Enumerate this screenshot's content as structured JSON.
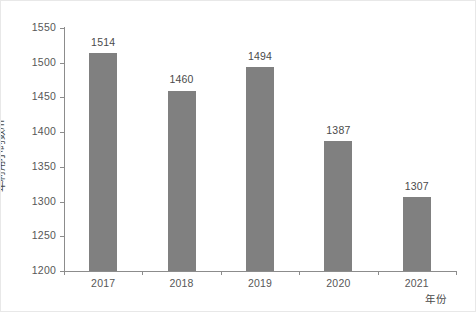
{
  "chart_data": {
    "type": "bar",
    "title": "",
    "subtitle": "",
    "categories": [
      "2017",
      "2018",
      "2019",
      "2020",
      "2021"
    ],
    "values": [
      1514,
      1460,
      1494,
      1387,
      1307
    ],
    "data_labels": [
      "1514",
      "1460",
      "1494",
      "1387",
      "1307"
    ],
    "xlabel": "年份",
    "ylabel": "年利用小时数/h",
    "ylim": [
      1200,
      1550
    ],
    "y_ticks": [
      1200,
      1250,
      1300,
      1350,
      1400,
      1450,
      1500,
      1550
    ],
    "y_tick_labels": [
      "1200",
      "1250",
      "1300",
      "1350",
      "1400",
      "1450",
      "1500",
      "1550"
    ],
    "grid": false,
    "legend": null,
    "legend_position": "none",
    "series": [
      {
        "name": "年利用小时数",
        "values": [
          1514,
          1460,
          1494,
          1387,
          1307
        ]
      }
    ],
    "colors": {
      "bar_fill": "#808080",
      "axis_line": "#8c8c8c",
      "tick_label": "#575757",
      "data_label": "#4a4a4a",
      "axis_title": "#4a4a4a",
      "background": "#ffffff",
      "figure_border": "#e8e8e8"
    }
  }
}
